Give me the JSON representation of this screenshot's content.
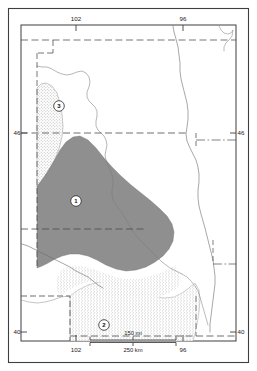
{
  "figure": {
    "type": "thematic-map"
  },
  "frame": {
    "outer_border_color": "#3a3a3a",
    "inner_border_color": "#3a3a3a"
  },
  "graticule": {
    "longitude_ticks": [
      {
        "label": "102",
        "x_fraction": 0.255
      },
      {
        "label": "96",
        "x_fraction": 0.755
      }
    ],
    "latitude_ticks": [
      {
        "label": "46",
        "y_fraction": 0.318
      },
      {
        "label": "40",
        "y_fraction": 0.905
      }
    ],
    "top_labels": [
      "102",
      "96"
    ],
    "bottom_labels": [
      "102",
      "96"
    ],
    "left_labels": [
      "46",
      "40"
    ],
    "right_labels": [
      "46",
      "40"
    ]
  },
  "regions": [
    {
      "id": "region-1",
      "label": "1",
      "fill": "#8f8f8f",
      "style": "solid-dark-gray",
      "marker_x": 76,
      "marker_y": 201
    },
    {
      "id": "region-2",
      "label": "2",
      "fill": "#dcdcdc",
      "style": "stipple-light",
      "marker_x": 104,
      "marker_y": 325
    },
    {
      "id": "region-3",
      "label": "3",
      "fill": "#e4e4e4",
      "style": "stipple-light",
      "marker_x": 59,
      "marker_y": 106
    }
  ],
  "scale_bar": {
    "miles": {
      "value": "150",
      "unit": "mi",
      "label": "150 mi"
    },
    "kilometers": {
      "value": "250",
      "unit": "km",
      "label": "250 km"
    }
  },
  "colors": {
    "background": "#ffffff",
    "line": "#5a5a5a",
    "border": "#3a3a3a",
    "region_dark": "#8f8f8f",
    "region_light": "#dfdfdf",
    "text": "#1a1a1a"
  }
}
